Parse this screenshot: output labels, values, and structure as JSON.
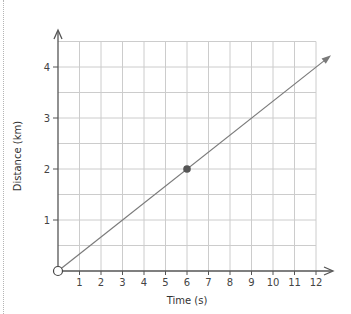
{
  "chart_data": {
    "type": "line",
    "title": "",
    "xlabel": "Time (s)",
    "ylabel": "Distance (km)",
    "xlim": [
      0,
      12
    ],
    "ylim": [
      0,
      4.5
    ],
    "x_ticks": [
      1,
      2,
      3,
      4,
      5,
      6,
      7,
      8,
      9,
      10,
      11,
      12
    ],
    "y_ticks": [
      1,
      2,
      3,
      4
    ],
    "grid": true,
    "grid_x_step": 1,
    "grid_y_step": 0.5,
    "series": [
      {
        "name": "distance-time line",
        "x": [
          0,
          6,
          12.7
        ],
        "y": [
          0,
          2,
          4.23
        ],
        "slope": 0.3333,
        "arrow_end": true
      }
    ],
    "points": [
      {
        "x": 0,
        "y": 0,
        "style": "open-circle"
      },
      {
        "x": 6,
        "y": 2,
        "style": "filled-circle"
      }
    ],
    "colors": {
      "grid": "#cccccc",
      "axis": "#555555",
      "line": "#7a7a7a",
      "point": "#555555"
    }
  }
}
